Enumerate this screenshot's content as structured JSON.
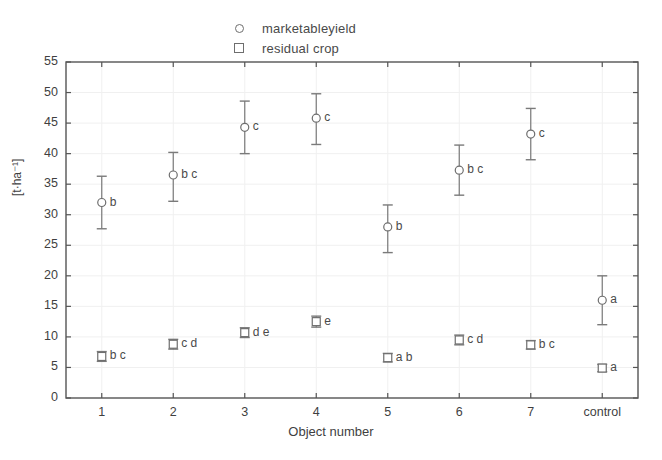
{
  "chart_data": {
    "type": "scatter",
    "title": "",
    "xlabel": "Object number",
    "ylabel": "[t·ha⁻¹]",
    "categories": [
      "1",
      "2",
      "3",
      "4",
      "5",
      "6",
      "7",
      "control"
    ],
    "ylim": [
      0,
      55
    ],
    "yticks": [
      0,
      5,
      10,
      15,
      20,
      25,
      30,
      35,
      40,
      45,
      50,
      55
    ],
    "grid": true,
    "legend_position": "top-center",
    "series": [
      {
        "name": "marketableyield",
        "marker": "circle",
        "values": [
          32.0,
          36.5,
          44.3,
          45.8,
          28.0,
          37.3,
          43.2,
          16.0
        ],
        "err_low": [
          27.7,
          32.2,
          40.0,
          41.5,
          23.8,
          33.2,
          39.0,
          12.0
        ],
        "err_high": [
          36.3,
          40.2,
          48.6,
          49.8,
          31.6,
          41.4,
          47.4,
          20.0
        ],
        "point_labels": [
          "b",
          "b c",
          "c",
          "c",
          "b",
          "b c",
          "c",
          "a"
        ]
      },
      {
        "name": "residual crop",
        "marker": "square",
        "values": [
          6.8,
          8.8,
          10.7,
          12.5,
          6.6,
          9.5,
          8.7,
          4.9
        ],
        "err_low": [
          6.0,
          8.0,
          9.9,
          11.6,
          5.9,
          8.7,
          8.0,
          4.3
        ],
        "err_high": [
          7.6,
          9.6,
          11.5,
          13.4,
          7.3,
          10.3,
          9.4,
          5.5
        ],
        "point_labels": [
          "b c",
          "c d",
          "d e",
          "e",
          "a b",
          "c d",
          "b c",
          "a"
        ]
      }
    ]
  },
  "legend": {
    "items": [
      {
        "label": "marketableyield",
        "marker": "circle"
      },
      {
        "label": "residual crop",
        "marker": "square"
      }
    ]
  },
  "axes": {
    "y_title": "[t·ha⁻¹]",
    "x_title": "Object number",
    "y_tick_labels": [
      "0",
      "5",
      "10",
      "15",
      "20",
      "25",
      "30",
      "35",
      "40",
      "45",
      "50",
      "55"
    ],
    "x_tick_labels": [
      "1",
      "2",
      "3",
      "4",
      "5",
      "6",
      "7",
      "control"
    ]
  },
  "colors": {
    "marker_stroke": "#6e6e6e",
    "error_bar": "#7a7a7a",
    "frame": "#555555",
    "grid": "#f0f0f0",
    "text": "#3f3f3f"
  }
}
